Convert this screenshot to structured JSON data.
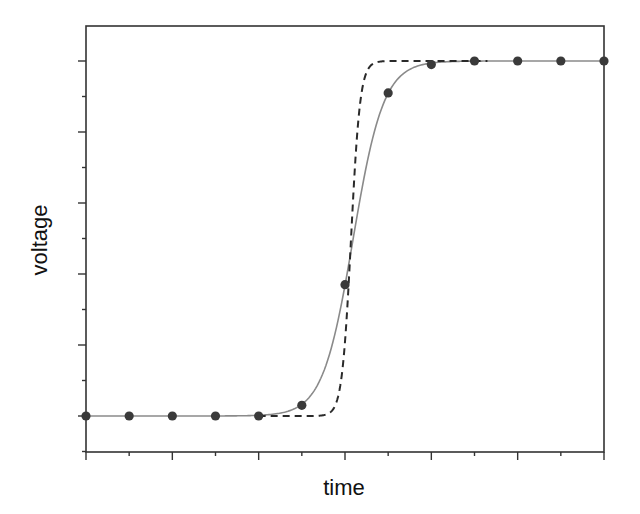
{
  "chart_data": {
    "type": "line",
    "title": "",
    "xlabel": "time",
    "ylabel": "voltage",
    "xlim": [
      0,
      12
    ],
    "ylim": [
      -0.1,
      1.1
    ],
    "x_ticks": [
      0,
      1,
      2,
      3,
      4,
      5,
      6,
      7,
      8,
      9,
      10,
      11,
      12
    ],
    "x_major_ticks": [
      0,
      2,
      4,
      6,
      8,
      10,
      12
    ],
    "y_ticks": [
      -0.1,
      0.0,
      0.1,
      0.2,
      0.3,
      0.4,
      0.5,
      0.6,
      0.7,
      0.8,
      0.9,
      1.0
    ],
    "y_major_ticks": [
      0.0,
      0.2,
      0.4,
      0.6,
      0.8,
      1.0
    ],
    "tick_labels_shown": false,
    "grid": false,
    "legend": null,
    "series": [
      {
        "name": "measured samples",
        "kind": "scatter",
        "color": "#3a3a3a",
        "x": [
          0,
          1,
          2,
          3,
          4,
          5,
          6,
          7,
          8,
          9,
          10,
          11,
          12
        ],
        "y": [
          0.0,
          0.0,
          0.0,
          0.0,
          0.0,
          0.03,
          0.37,
          0.91,
          0.99,
          1.0,
          1.0,
          1.0,
          1.0
        ]
      },
      {
        "name": "fitted response",
        "kind": "line",
        "style": "solid",
        "color": "#8a8a8a",
        "model": "logistic",
        "center": 6.19,
        "steepness": 2.84
      },
      {
        "name": "ideal step",
        "kind": "line",
        "style": "dashed",
        "color": "#2a2a2a",
        "model": "logistic",
        "center": 6.14,
        "steepness": 9.5,
        "x_start": 4,
        "x_end": 9.3
      }
    ]
  }
}
